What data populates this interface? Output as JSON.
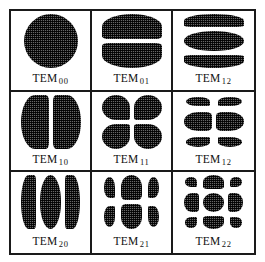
{
  "figure": {
    "kind": "tem-laser-transverse-mode-chart",
    "frame_color": "#1a1a1a",
    "background_color": "#ffffff",
    "lobe_fill_color": "#2b2b2b",
    "grid_rows": 3,
    "grid_cols": 3
  },
  "chart_data": {
    "type": "table",
    "title": "",
    "xlabel": "",
    "ylabel": "",
    "grid": true,
    "legend": "none",
    "rows": 3,
    "cols": 3,
    "cells": [
      {
        "label_base": "TEM",
        "label_sub": "00",
        "mode_m": 0,
        "mode_n": 0,
        "lobe_count": 1,
        "pattern": "single-disc",
        "lobe_cols": 1,
        "lobe_rows": 1
      },
      {
        "label_base": "TEM",
        "label_sub": "01",
        "mode_m": 0,
        "mode_n": 1,
        "lobe_count": 2,
        "pattern": "two-horizontal-lobes",
        "lobe_cols": 1,
        "lobe_rows": 2
      },
      {
        "label_base": "TEM",
        "label_sub": "12",
        "mode_m": 1,
        "mode_n": 2,
        "lobe_count": 3,
        "pattern": "three-horizontal-lobes",
        "lobe_cols": 1,
        "lobe_rows": 3
      },
      {
        "label_base": "TEM",
        "label_sub": "10",
        "mode_m": 1,
        "mode_n": 0,
        "lobe_count": 2,
        "pattern": "two-vertical-lobes",
        "lobe_cols": 2,
        "lobe_rows": 1
      },
      {
        "label_base": "TEM",
        "label_sub": "11",
        "mode_m": 1,
        "mode_n": 1,
        "lobe_count": 4,
        "pattern": "two-by-two-quadrants",
        "lobe_cols": 2,
        "lobe_rows": 2
      },
      {
        "label_base": "TEM",
        "label_sub": "12",
        "mode_m": 1,
        "mode_n": 2,
        "lobe_count": 6,
        "pattern": "two-by-three-lobes",
        "lobe_cols": 2,
        "lobe_rows": 3
      },
      {
        "label_base": "TEM",
        "label_sub": "20",
        "mode_m": 2,
        "mode_n": 0,
        "lobe_count": 3,
        "pattern": "three-vertical-lobes",
        "lobe_cols": 3,
        "lobe_rows": 1
      },
      {
        "label_base": "TEM",
        "label_sub": "21",
        "mode_m": 2,
        "mode_n": 1,
        "lobe_count": 6,
        "pattern": "three-by-two-lobes",
        "lobe_cols": 3,
        "lobe_rows": 2
      },
      {
        "label_base": "TEM",
        "label_sub": "22",
        "mode_m": 2,
        "mode_n": 2,
        "lobe_count": 9,
        "pattern": "three-by-three-lobes",
        "lobe_cols": 3,
        "lobe_rows": 3
      }
    ]
  }
}
